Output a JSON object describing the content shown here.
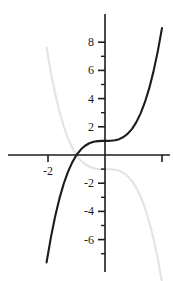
{
  "chart_data": {
    "type": "line",
    "title": "",
    "xlabel": "",
    "ylabel": "",
    "xlim": [
      -7.0,
      4.9
    ],
    "ylim": [
      -8.3,
      9.1
    ],
    "grid": false,
    "legend": "none",
    "x_ticks_major": [
      -2,
      2
    ],
    "x_tick_labels": [
      "-2",
      ""
    ],
    "y_ticks_major": [
      8,
      6,
      4,
      2,
      -2,
      -4,
      -6
    ],
    "y_tick_labels": [
      "8",
      "6",
      "4",
      "2",
      "-2",
      "-4",
      "-6"
    ],
    "y_ticks_minor": [
      7,
      5,
      3,
      1,
      -1,
      -3,
      -5,
      -7
    ],
    "x_ticks_minor": [],
    "series": [
      {
        "name": "cubic",
        "expression": "y = x^3 + 1",
        "color": "#1c1c1c",
        "width": 2.1,
        "x": [
          -2.05,
          -1.9,
          -1.75,
          -1.6,
          -1.45,
          -1.3,
          -1.15,
          -1.0,
          -0.85,
          -0.7,
          -0.55,
          -0.4,
          -0.25,
          -0.1,
          0.05,
          0.2,
          0.35,
          0.5,
          0.65,
          0.8,
          0.95,
          1.1,
          1.25,
          1.4,
          1.55,
          1.7,
          1.85,
          2.0
        ],
        "y": [
          -7.615,
          -5.859,
          -4.359,
          -3.096,
          -2.049,
          -1.197,
          -0.521,
          0.0,
          0.386,
          0.657,
          0.834,
          0.936,
          0.984,
          0.999,
          1.0,
          1.008,
          1.043,
          1.125,
          1.275,
          1.512,
          1.857,
          2.331,
          2.953,
          3.744,
          4.724,
          5.913,
          7.332,
          9.0
        ]
      },
      {
        "name": "cubic-reflected",
        "expression": "y = -(x^3 + 1)",
        "color": "#e3e3e3",
        "width": 2.1,
        "x": [
          -2.05,
          -1.9,
          -1.75,
          -1.6,
          -1.45,
          -1.3,
          -1.15,
          -1.0,
          -0.85,
          -0.7,
          -0.55,
          -0.4,
          -0.25,
          -0.1,
          0.05,
          0.2,
          0.35,
          0.5,
          0.65,
          0.8,
          0.95,
          1.1,
          1.25,
          1.4,
          1.55,
          1.7,
          1.85,
          2.0
        ],
        "y": [
          7.615,
          5.859,
          4.359,
          3.096,
          2.049,
          1.197,
          0.521,
          0.0,
          -0.386,
          -0.657,
          -0.834,
          -0.936,
          -0.984,
          -0.999,
          -1.0,
          -1.008,
          -1.043,
          -1.125,
          -1.275,
          -1.512,
          -1.857,
          -2.331,
          -2.953,
          -3.744,
          -4.724,
          -5.913,
          -7.332,
          -9.0
        ]
      }
    ],
    "axis_color": "#1c1c1c",
    "background": "#ffffff"
  },
  "geometry": {
    "origin_x": 105,
    "origin_y": 155,
    "unit_px_x": 28.5,
    "unit_px_y": 14.1,
    "x_axis_start": 8,
    "x_axis_end": 170,
    "y_axis_top": 14,
    "y_axis_bottom": 272,
    "major_tick_len": 7,
    "minor_tick_len": 4
  }
}
